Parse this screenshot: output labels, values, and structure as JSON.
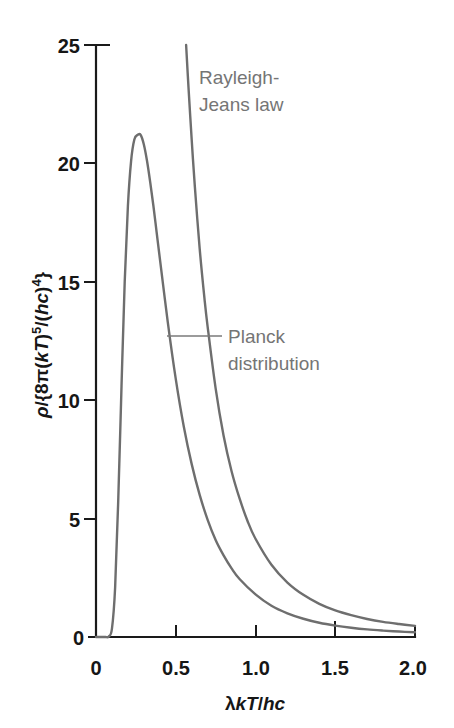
{
  "chart_data": {
    "type": "line",
    "title": "",
    "subtitle": "",
    "xlabel": "λkT/hc",
    "ylabel": "ρ/{8π(kT)⁵/(hc)⁴}",
    "xlim": [
      0,
      2.0
    ],
    "ylim": [
      0,
      25
    ],
    "grid": false,
    "legend_position": "inline-annotation",
    "xticks": [
      "0",
      "0.5",
      "1.0",
      "1.5",
      "2.0"
    ],
    "xtick_values": [
      0,
      0.5,
      1.0,
      1.5,
      2.0
    ],
    "yticks": [
      "0",
      "5",
      "10",
      "15",
      "20",
      "25"
    ],
    "ytick_values": [
      0,
      5,
      10,
      15,
      20,
      25
    ],
    "annotations": [
      {
        "name": "rayleigh-jeans-label",
        "line1": "Rayleigh-",
        "line2": "Jeans law",
        "text": "Rayleigh-Jeans law",
        "x": 0.6,
        "y": 23.0
      },
      {
        "name": "planck-label",
        "line1": "Planck",
        "line2": "distribution",
        "text": "Planck distribution",
        "x": 0.8,
        "y": 12.8,
        "leader_from_x": 0.45,
        "leader_to_x": 0.79,
        "leader_y": 12.7
      }
    ],
    "series": [
      {
        "name": "Planck distribution",
        "color": "#6e6e6e",
        "peak_x": 0.28,
        "peak_y": 21.2,
        "x": [
          0.0,
          0.02,
          0.04,
          0.06,
          0.08,
          0.1,
          0.12,
          0.14,
          0.16,
          0.18,
          0.2,
          0.22,
          0.24,
          0.26,
          0.28,
          0.3,
          0.32,
          0.34,
          0.36,
          0.38,
          0.4,
          0.45,
          0.5,
          0.55,
          0.6,
          0.65,
          0.7,
          0.75,
          0.8,
          0.85,
          0.9,
          1.0,
          1.1,
          1.2,
          1.3,
          1.4,
          1.5,
          1.6,
          1.7,
          1.8,
          1.9,
          2.0
        ],
        "y": [
          0.0,
          0.0,
          0.0,
          0.0,
          0.02,
          0.35,
          2.1,
          5.9,
          10.6,
          15.0,
          18.2,
          20.1,
          21.0,
          21.2,
          21.2,
          20.8,
          20.1,
          19.2,
          18.2,
          17.1,
          16.0,
          13.3,
          10.9,
          8.9,
          7.3,
          6.0,
          4.95,
          4.1,
          3.45,
          2.9,
          2.45,
          1.8,
          1.32,
          1.0,
          0.77,
          0.6,
          0.48,
          0.39,
          0.32,
          0.27,
          0.23,
          0.2
        ]
      },
      {
        "name": "Rayleigh-Jeans law",
        "color": "#6e6e6e",
        "note": "Diverges as 1/x^4 at small x; exits top of plot near x = 0.565",
        "x": [
          0.565,
          0.58,
          0.6,
          0.62,
          0.65,
          0.68,
          0.7,
          0.75,
          0.8,
          0.85,
          0.9,
          0.95,
          1.0,
          1.1,
          1.2,
          1.3,
          1.4,
          1.5,
          1.6,
          1.7,
          1.8,
          1.9,
          2.0
        ],
        "y": [
          25.0,
          23.2,
          21.0,
          19.0,
          16.4,
          14.3,
          13.1,
          10.5,
          8.5,
          7.0,
          5.85,
          4.9,
          4.15,
          3.05,
          2.3,
          1.78,
          1.4,
          1.12,
          0.92,
          0.76,
          0.64,
          0.55,
          0.47
        ]
      }
    ]
  },
  "axis": {
    "y_label_parts": {
      "rho": "ρ",
      "slash_open": "/{8π(",
      "kT": "kT",
      "close_sup": ")",
      "sup5": "5",
      "mid": "/(",
      "hc": "hc",
      "close2": ")",
      "sup4": "4",
      "brace": "}"
    },
    "x_label_parts": {
      "lambda": "λ",
      "kT": "kT",
      "slash": "/",
      "hc": "hc"
    }
  }
}
